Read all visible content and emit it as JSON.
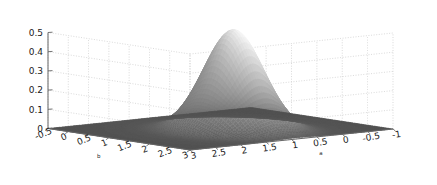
{
  "figure": {
    "kind": "3d-surface-plot",
    "background_color": "#ffffff",
    "pane_color": "#ffffff",
    "grid_color": "#c8c8c8",
    "axis_line_color": "#666666",
    "tick_label_color": "#1a1a1a",
    "surface_base_color": "#4a4a4a",
    "surface_peak_color": "#f2f2f2",
    "surface_mid_color": "#9a9a9a",
    "surface_shadow_color": "#3c3c3c"
  },
  "chart_data": {
    "type": "surface",
    "title": "",
    "xlabel": "a",
    "ylabel": "b",
    "zlabel": "",
    "grid": true,
    "legend": "none",
    "xlim": [
      -1,
      3
    ],
    "ylim": [
      -0.5,
      3
    ],
    "zlim": [
      0,
      0.5
    ],
    "x_ticks": [
      3,
      2.5,
      2,
      1.5,
      1,
      0.5,
      0,
      -0.5,
      -1
    ],
    "x_tick_labels": [
      "3",
      "2.5",
      "2",
      "1.5",
      "1",
      "0.5",
      "0",
      "-0.5",
      "-1"
    ],
    "y_ticks": [
      -0.5,
      0,
      0.5,
      1,
      1.5,
      2,
      2.5,
      3
    ],
    "y_tick_labels": [
      "-0.5",
      "0",
      "0.5",
      "1",
      "1.5",
      "2",
      "2.5",
      "3"
    ],
    "z_ticks": [
      0,
      0.1,
      0.2,
      0.3,
      0.4,
      0.5
    ],
    "z_tick_labels": [
      "0",
      "0.1",
      "0.2",
      "0.3",
      "0.4",
      "0.5"
    ],
    "peak": {
      "a": 0.9,
      "b": 1.45,
      "z": 0.52
    },
    "surface_model": {
      "amplitude": 0.52,
      "center_x": 0.9,
      "center_y": 1.45,
      "sigma_x": 0.42,
      "sigma_y": 0.52,
      "floor": 0.0
    },
    "z_samples": {
      "note": "z(a,b) grid values, rows are b from -0.5 to 3, columns are a from -1 to 3",
      "a_grid": [
        -1,
        -0.5,
        0,
        0.5,
        1,
        1.5,
        2,
        2.5,
        3
      ],
      "b_grid": [
        -0.5,
        0,
        0.5,
        1,
        1.5,
        2,
        2.5,
        3
      ],
      "values": [
        [
          0.0,
          0.0,
          0.001,
          0.002,
          0.002,
          0.001,
          0.0,
          0.0,
          0.0
        ],
        [
          0.0,
          0.001,
          0.008,
          0.022,
          0.026,
          0.011,
          0.001,
          0.0,
          0.0
        ],
        [
          0.0,
          0.004,
          0.045,
          0.131,
          0.152,
          0.063,
          0.007,
          0.0,
          0.0
        ],
        [
          0.001,
          0.009,
          0.105,
          0.305,
          0.354,
          0.148,
          0.016,
          0.001,
          0.0
        ],
        [
          0.001,
          0.011,
          0.13,
          0.378,
          0.439,
          0.183,
          0.02,
          0.001,
          0.0
        ],
        [
          0.0,
          0.006,
          0.068,
          0.199,
          0.231,
          0.096,
          0.01,
          0.0,
          0.0
        ],
        [
          0.0,
          0.001,
          0.014,
          0.042,
          0.049,
          0.02,
          0.002,
          0.0,
          0.0
        ],
        [
          0.0,
          0.0,
          0.001,
          0.004,
          0.004,
          0.002,
          0.0,
          0.0,
          0.0
        ]
      ]
    }
  },
  "axis_labels": {
    "a": "a",
    "b": "b"
  }
}
